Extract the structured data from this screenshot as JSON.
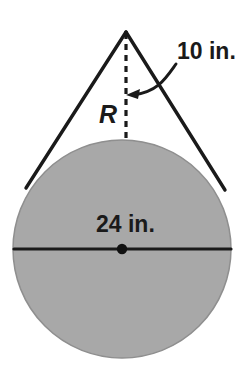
{
  "figure": {
    "labels": {
      "slant": "10 in.",
      "radius": "R",
      "diameter": "24 in."
    },
    "colors": {
      "circle_fill": "#a8a8a8",
      "circle_stroke": "#8a8a8a",
      "line": "#1a1a1a",
      "text": "#1a1a1a",
      "background": "#ffffff"
    },
    "geometry": {
      "circle": {
        "cx": 122,
        "cy": 249,
        "r": 109
      },
      "apex": {
        "x": 126,
        "y": 31
      },
      "tangent_left": {
        "x": 26,
        "y": 188
      },
      "tangent_right": {
        "x": 225,
        "y": 190
      },
      "dashed_segment": {
        "x": 126,
        "y1": 33,
        "y2": 141
      },
      "diameter_line": {
        "x1": 14,
        "x2": 231,
        "y": 249
      },
      "center_dot": {
        "cx": 122,
        "cy": 249,
        "r": 5
      },
      "arrow_tip": {
        "x": 127,
        "y": 95
      }
    }
  }
}
